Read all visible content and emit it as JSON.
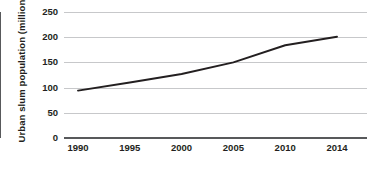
{
  "chart_data": {
    "type": "line",
    "title": "",
    "xlabel": "",
    "ylabel": "Urban slum population (millions)",
    "categories": [
      "1990",
      "1995",
      "2000",
      "2005",
      "2010",
      "2014"
    ],
    "x": [
      1990,
      1995,
      2000,
      2005,
      2010,
      2014
    ],
    "values": [
      94,
      110,
      127,
      150,
      184,
      201
    ],
    "series": [
      {
        "name": "Urban slum population",
        "values": [
          94,
          110,
          127,
          150,
          184,
          201
        ],
        "color": "#231f20"
      }
    ],
    "ylim": [
      0,
      250
    ],
    "yticks": [
      0,
      50,
      100,
      150,
      200,
      250
    ],
    "ytick_labels": [
      "0",
      "50",
      "100",
      "150",
      "200",
      "250"
    ],
    "xtick_labels": [
      "1990",
      "1995",
      "2000",
      "2005",
      "2010",
      "2014"
    ],
    "grid": "horizontal",
    "legend": "none",
    "annotations": []
  },
  "colors": {
    "series_line": "#231f20",
    "gridline": "#c7c8ca",
    "axis": "#58595b",
    "text": "#231f20",
    "background": "#ffffff"
  },
  "axis": {
    "y_title": "Urban slum population (millions)"
  },
  "ticks": {
    "y": [
      {
        "label": "250",
        "value": 250
      },
      {
        "label": "200",
        "value": 200
      },
      {
        "label": "150",
        "value": 150
      },
      {
        "label": "100",
        "value": 100
      },
      {
        "label": "50",
        "value": 50
      },
      {
        "label": "0",
        "value": 0
      }
    ],
    "x": [
      {
        "label": "1990"
      },
      {
        "label": "1995"
      },
      {
        "label": "2000"
      },
      {
        "label": "2005"
      },
      {
        "label": "2010"
      },
      {
        "label": "2014"
      }
    ]
  }
}
